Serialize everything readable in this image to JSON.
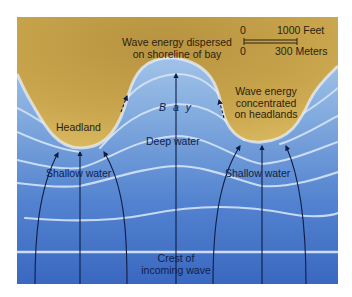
{
  "diagram": {
    "colors": {
      "land": "#c9a24a",
      "land_light": "#d9b75e",
      "water_shallow": "#a9c9ec",
      "water_deep": "#3d6ec4",
      "crest_line": "#dce9f8",
      "orthogonal": "#0e1c46",
      "frame_bg": "#ffffff"
    },
    "labels": {
      "headland": "Headland",
      "shallow_left": "Shallow water",
      "shallow_right": "Shallow water",
      "bay": "B a y",
      "deep_water": "Deep water",
      "dispersed_line1": "Wave energy dispersed",
      "dispersed_line2": "on shoreline of bay",
      "concentrated_line1": "Wave energy",
      "concentrated_line2": "concentrated",
      "concentrated_line3": "on headlands",
      "crest_line1": "Crest of",
      "crest_line2": "incoming wave"
    },
    "scale_bar": {
      "feet_start": "0",
      "feet_end": "1000 Feet",
      "meters_start": "0",
      "meters_end": "300 Meters"
    },
    "features": [
      {
        "name": "left-headland",
        "type": "land"
      },
      {
        "name": "bay",
        "type": "water"
      },
      {
        "name": "right-headland",
        "type": "land"
      }
    ],
    "orthogonals": 7,
    "wave_crests": 6
  }
}
